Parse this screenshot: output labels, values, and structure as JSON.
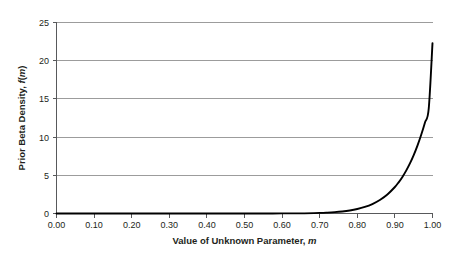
{
  "chart_data": {
    "type": "line",
    "title": "",
    "xlabel": "Value of Unknown Parameter, m",
    "xlabel_plain": "Value of Unknown Parameter,",
    "xlabel_italic": "m",
    "ylabel": "Prior Beta Density, f(m)",
    "ylabel_plain": "Prior Beta Density,",
    "ylabel_italic_f": "f",
    "ylabel_paren_open": "(",
    "ylabel_italic_m": "m",
    "ylabel_paren_close": ")",
    "xlim": [
      0.0,
      1.0
    ],
    "ylim": [
      0,
      25
    ],
    "grid": "horizontal",
    "legend": "none",
    "curve_color": "#000000",
    "gridline_color": "#9c9c9c",
    "axis_color": "#58595b",
    "background_color": "#ffffff",
    "xticks": [
      "0.00",
      "0.10",
      "0.20",
      "0.30",
      "0.40",
      "0.50",
      "0.60",
      "0.70",
      "0.80",
      "0.90",
      "1.00"
    ],
    "xtick_values": [
      0.0,
      0.1,
      0.2,
      0.3,
      0.4,
      0.5,
      0.6,
      0.7,
      0.8,
      0.9,
      1.0
    ],
    "yticks": [
      "0",
      "5",
      "10",
      "15",
      "20",
      "25"
    ],
    "ytick_values": [
      0,
      5,
      10,
      15,
      20,
      25
    ],
    "series": [
      {
        "name": "Prior Beta Density",
        "x": [
          0.0,
          0.05,
          0.1,
          0.15,
          0.2,
          0.25,
          0.3,
          0.35,
          0.4,
          0.45,
          0.5,
          0.55,
          0.6,
          0.65,
          0.7,
          0.72,
          0.74,
          0.76,
          0.78,
          0.8,
          0.82,
          0.84,
          0.86,
          0.88,
          0.9,
          0.91,
          0.92,
          0.93,
          0.94,
          0.95,
          0.96,
          0.97,
          0.98,
          0.99,
          1.0
        ],
        "y": [
          0.0,
          0.0,
          0.0,
          0.0,
          0.0,
          0.0,
          0.0,
          0.0,
          0.0,
          0.0,
          0.0,
          0.0,
          0.01,
          0.02,
          0.08,
          0.12,
          0.18,
          0.27,
          0.4,
          0.59,
          0.86,
          1.24,
          1.77,
          2.49,
          3.47,
          4.08,
          4.79,
          5.61,
          6.55,
          7.64,
          8.88,
          10.3,
          11.91,
          13.74,
          22.3
        ]
      }
    ]
  }
}
